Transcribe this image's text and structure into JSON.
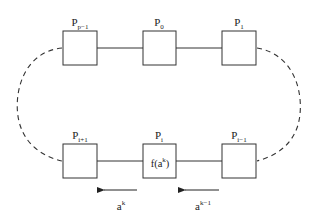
{
  "diagram": {
    "type": "ring-of-processors",
    "stroke_color": "#333333",
    "top_row": [
      {
        "id": "p_pm1",
        "base": "P",
        "sub": "p−1",
        "content": ""
      },
      {
        "id": "p_0",
        "base": "P",
        "sub": "0",
        "content": ""
      },
      {
        "id": "p_1",
        "base": "P",
        "sub": "1",
        "content": ""
      }
    ],
    "bottom_row": [
      {
        "id": "p_ip1",
        "base": "P",
        "sub": "i+1",
        "content": ""
      },
      {
        "id": "p_i",
        "base": "P",
        "sub": "i",
        "content_base": "f(a",
        "content_sup": "k",
        "content_tail": ")"
      },
      {
        "id": "p_im1",
        "base": "P",
        "sub": "i−1",
        "content": ""
      }
    ],
    "arrows": [
      {
        "id": "arrow_left",
        "direction": "left",
        "label_base": "a",
        "label_sup": "k"
      },
      {
        "id": "arrow_right",
        "direction": "left",
        "label_base": "a",
        "label_sup": "k−1"
      }
    ],
    "connections": {
      "solid": [
        "P_{p-1}–P_0",
        "P_0–P_1",
        "P_{i+1}–P_i",
        "P_i–P_{i-1}"
      ],
      "dashed": [
        "P_{p-1}–P_{i+1} (left arc)",
        "P_1–P_{i-1} (right arc)"
      ]
    }
  }
}
